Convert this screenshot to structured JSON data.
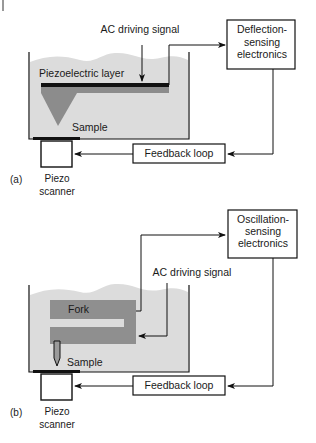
{
  "figure": {
    "corner_mark": "|",
    "colors": {
      "liquid": "#dcdcdc",
      "cantilever_gray": "#8c8c8c",
      "fork_gray": "#8f8f8f",
      "line": "#111111",
      "background": "#ffffff"
    },
    "panel_a": {
      "label": "(a)",
      "ac_signal_label": "AC driving signal",
      "piezo_layer_label": "Piezoelectric layer",
      "sample_label": "Sample",
      "sensing_box": {
        "line1": "Deflection-",
        "line2": "sensing",
        "line3": "electronics"
      },
      "feedback_label": "Feedback loop",
      "scanner_line1": "Piezo",
      "scanner_line2": "scanner"
    },
    "panel_b": {
      "label": "(b)",
      "ac_signal_label": "AC driving signal",
      "fork_label": "Fork",
      "sample_label": "Sample",
      "sensing_box": {
        "line1": "Oscillation-",
        "line2": "sensing",
        "line3": "electronics"
      },
      "feedback_label": "Feedback loop",
      "scanner_line1": "Piezo",
      "scanner_line2": "scanner"
    }
  }
}
